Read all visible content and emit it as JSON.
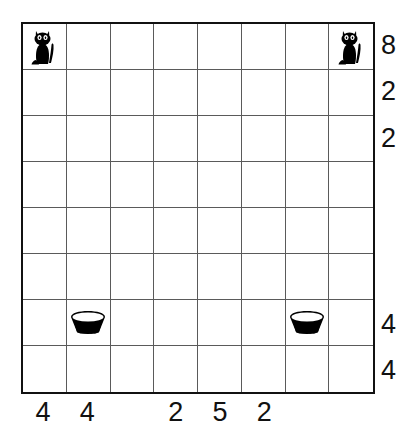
{
  "puzzle": {
    "title": "Cat and Bowl Grid Puzzle",
    "grid": {
      "rows": 8,
      "columns": 8,
      "border_color": "#111111",
      "line_color": "#5a5a5a",
      "background_color": "#ffffff"
    },
    "row_clues": [
      "8",
      "2",
      "2",
      "",
      "",
      "",
      "4",
      "4"
    ],
    "column_clues": [
      "4",
      "4",
      "",
      "2",
      "5",
      "2",
      "",
      ""
    ],
    "icons": {
      "cat": "cat-icon",
      "bowl": "bowl-icon"
    },
    "pieces": [
      {
        "type": "cat",
        "row": 1,
        "col": 1,
        "name": "cat-icon"
      },
      {
        "type": "cat",
        "row": 1,
        "col": 8,
        "name": "cat-icon"
      },
      {
        "type": "bowl",
        "row": 7,
        "col": 2,
        "name": "bowl-icon"
      },
      {
        "type": "bowl",
        "row": 7,
        "col": 7,
        "name": "bowl-icon"
      }
    ]
  }
}
